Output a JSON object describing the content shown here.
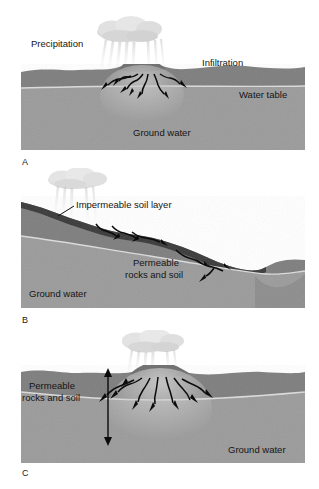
{
  "figure": {
    "background_color": "#ffffff",
    "width": 319,
    "height": 489
  },
  "palette": {
    "unsaturated_soil": "#7c7c7c",
    "saturated_soil": "#9a9a9a",
    "impermeable_layer": "#3b3b3b",
    "water_table_line": "#d8d8d8",
    "arrow": "#0d0d0d",
    "cloud": "#d9d9d9",
    "rain": "#c9c9c9",
    "text": "#151515"
  },
  "panels": [
    {
      "id": "A",
      "label": "A",
      "name": "panel-a-permeable-ground",
      "labels": [
        {
          "id": "precipitation",
          "text": "Precipitation"
        },
        {
          "id": "infiltration",
          "text": "Infiltration"
        },
        {
          "id": "water-table",
          "text": "Water table"
        },
        {
          "id": "ground-water",
          "text": "Ground water"
        }
      ]
    },
    {
      "id": "B",
      "label": "B",
      "name": "panel-b-impermeable-layer",
      "labels": [
        {
          "id": "impermeable-soil-layer",
          "text": "Impermeable soil layer"
        },
        {
          "id": "permeable-line-1",
          "text": "Permeable"
        },
        {
          "id": "permeable-line-2",
          "text": "rocks and soil"
        },
        {
          "id": "ground-water",
          "text": "Ground water"
        }
      ]
    },
    {
      "id": "C",
      "label": "C",
      "name": "panel-c-deep-permeable",
      "labels": [
        {
          "id": "permeable-line-1",
          "text": "Permeable"
        },
        {
          "id": "permeable-line-2",
          "text": "rocks and soil"
        },
        {
          "id": "ground-water",
          "text": "Ground water"
        }
      ]
    }
  ]
}
